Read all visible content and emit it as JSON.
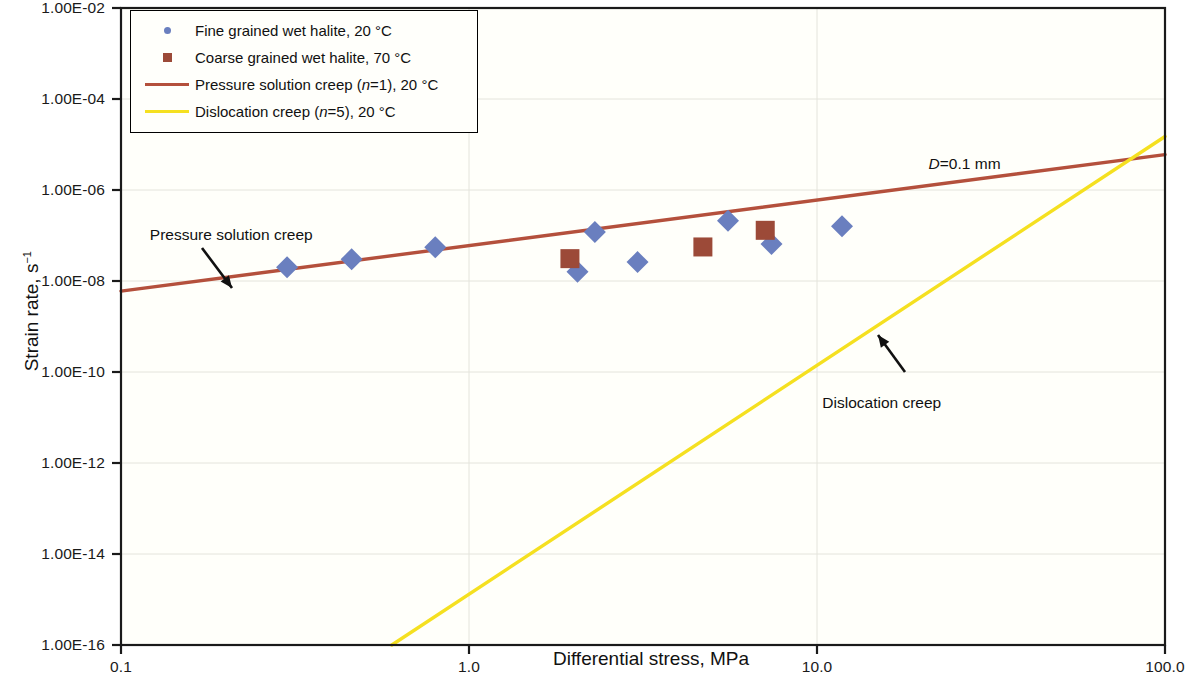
{
  "chart_data": {
    "type": "scatter",
    "title": "",
    "xlabel": "Differential stress, MPa",
    "ylabel": "Strain rate, s⁻¹",
    "xscale": "log",
    "yscale": "log",
    "xlim": [
      0.1,
      100.0
    ],
    "ylim": [
      1e-16,
      0.01
    ],
    "xticks": [
      "0.1",
      "1.0",
      "10.0",
      "100.0"
    ],
    "xtick_values": [
      0.1,
      1.0,
      10.0,
      100.0
    ],
    "yticks": [
      "1.00E-02",
      "1.00E-04",
      "1.00E-06",
      "1.00E-08",
      "1.00E-10",
      "1.00E-12",
      "1.00E-14",
      "1.00E-16"
    ],
    "ytick_values": [
      0.01,
      0.0001,
      1e-06,
      1e-08,
      1e-10,
      1e-12,
      1e-14,
      1e-16
    ],
    "grid": true,
    "legend_position": "top-left",
    "series": [
      {
        "name": "Fine grained wet halite, 20 °C",
        "type": "scatter",
        "marker": "diamond",
        "color": "#6a7fbf",
        "points": [
          {
            "x": 0.3,
            "y": 2e-08
          },
          {
            "x": 0.46,
            "y": 3e-08
          },
          {
            "x": 0.8,
            "y": 5.5e-08
          },
          {
            "x": 2.05,
            "y": 1.6e-08
          },
          {
            "x": 2.3,
            "y": 1.2e-07
          },
          {
            "x": 3.05,
            "y": 2.6e-08
          },
          {
            "x": 5.55,
            "y": 2.1e-07
          },
          {
            "x": 7.4,
            "y": 6.5e-08
          },
          {
            "x": 11.8,
            "y": 1.6e-07
          }
        ]
      },
      {
        "name": "Coarse grained wet halite, 70 °C",
        "type": "scatter",
        "marker": "square",
        "color": "#9c4a38",
        "points": [
          {
            "x": 1.95,
            "y": 3.1e-08
          },
          {
            "x": 4.7,
            "y": 5.6e-08
          },
          {
            "x": 7.1,
            "y": 1.3e-07
          }
        ]
      },
      {
        "name": "Pressure solution creep (n=1), 20 °C",
        "type": "line",
        "color": "#b4503c",
        "n_exponent": 1,
        "points": [
          {
            "x": 0.1,
            "y": 6e-09
          },
          {
            "x": 100.0,
            "y": 6e-06
          }
        ]
      },
      {
        "name": "Dislocation creep (n=5), 20 °C",
        "type": "line",
        "color": "#f5e020",
        "n_exponent": 5,
        "points": [
          {
            "x": 0.6,
            "y": 1e-16
          },
          {
            "x": 100.0,
            "y": 1.5e-05
          }
        ]
      }
    ],
    "annotations": [
      {
        "name": "pressure-solution-creep-annotation",
        "text": "Pressure solution creep",
        "x": 0.14,
        "y": 1e-07
      },
      {
        "name": "dislocation-creep-annotation",
        "text": "Dislocation creep",
        "x": 13.5,
        "y": 2e-11
      },
      {
        "name": "grain-size-annotation",
        "text_italic": "D",
        "text": "=0.1 mm",
        "x": 28.0,
        "y": 3.5e-06
      }
    ]
  },
  "legend": {
    "items": [
      {
        "key": "diamond-marker-icon",
        "label": "Fine grained wet halite, 20 °C"
      },
      {
        "key": "square-marker-icon",
        "label": "Coarse grained wet halite, 70 °C"
      },
      {
        "key": "line-swatch-icon",
        "label_pre": "Pressure solution creep (",
        "label_italic": "n",
        "label_mid": "=1), 20 °C"
      },
      {
        "key": "line-swatch-icon",
        "label_pre": "Dislocation creep (",
        "label_italic": "n",
        "label_mid": "=5), 20 °C"
      }
    ]
  },
  "axes": {
    "y_title_main": "Strain rate, s",
    "y_title_sup": "−1",
    "x_title": "Differential stress, MPa"
  },
  "colors": {
    "diamond": "#6a7fbf",
    "square": "#9c4a38",
    "pressure_line": "#b4503c",
    "dislocation_line": "#f5e020",
    "plot_background": "#fffffa",
    "axis": "#1a1a1a",
    "grid": "#e4e4dc"
  }
}
